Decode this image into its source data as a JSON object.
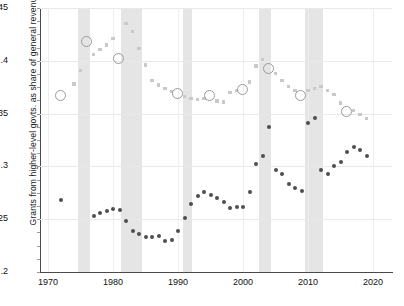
{
  "chart_data": {
    "type": "scatter",
    "title": "",
    "xlabel": "",
    "ylabel": "Grants from higher-level govts. as share of general revenue",
    "xlim": [
      1969,
      2021
    ],
    "ylim": [
      0.2,
      0.45
    ],
    "xticks": [
      1970,
      1980,
      1990,
      2000,
      2010,
      2020
    ],
    "yticks": [
      0.2,
      0.25,
      0.3,
      0.35,
      0.4,
      0.45
    ],
    "ytick_labels": [
      ".2",
      ".25",
      ".3",
      ".35",
      ".4",
      ".45"
    ],
    "grid": true,
    "legend": "none",
    "recession_bands": [
      {
        "start": 1974.6,
        "end": 1976.4
      },
      {
        "start": 1981.2,
        "end": 1984.5
      },
      {
        "start": 1990.7,
        "end": 1992.1
      },
      {
        "start": 2002.5,
        "end": 2004.3
      },
      {
        "start": 2009.5,
        "end": 2012.3
      }
    ],
    "series": [
      {
        "name": "Light series (open-circle census years)",
        "color": "#c9c9c9",
        "marker": "square-small",
        "highlight_marker": "open-circle",
        "points": [
          {
            "x": 1972,
            "y": 0.367,
            "highlight": true
          },
          {
            "x": 1974,
            "y": 0.378,
            "highlight": false
          },
          {
            "x": 1975,
            "y": 0.391,
            "highlight": false
          },
          {
            "x": 1976,
            "y": 0.418,
            "highlight": true
          },
          {
            "x": 1977,
            "y": 0.406,
            "highlight": false
          },
          {
            "x": 1978,
            "y": 0.411,
            "highlight": false
          },
          {
            "x": 1979,
            "y": 0.415,
            "highlight": false
          },
          {
            "x": 1980,
            "y": 0.421,
            "highlight": false
          },
          {
            "x": 1981,
            "y": 0.402,
            "highlight": true
          },
          {
            "x": 1982,
            "y": 0.435,
            "highlight": false
          },
          {
            "x": 1983,
            "y": 0.428,
            "highlight": false
          },
          {
            "x": 1984,
            "y": 0.412,
            "highlight": false
          },
          {
            "x": 1985,
            "y": 0.396,
            "highlight": false
          },
          {
            "x": 1986,
            "y": 0.381,
            "highlight": false
          },
          {
            "x": 1987,
            "y": 0.377,
            "highlight": false
          },
          {
            "x": 1988,
            "y": 0.374,
            "highlight": false
          },
          {
            "x": 1989,
            "y": 0.371,
            "highlight": false
          },
          {
            "x": 1990,
            "y": 0.368,
            "highlight": true
          },
          {
            "x": 1991,
            "y": 0.366,
            "highlight": false
          },
          {
            "x": 1992,
            "y": 0.364,
            "highlight": false
          },
          {
            "x": 1993,
            "y": 0.363,
            "highlight": false
          },
          {
            "x": 1994,
            "y": 0.364,
            "highlight": false
          },
          {
            "x": 1995,
            "y": 0.367,
            "highlight": true
          },
          {
            "x": 1996,
            "y": 0.362,
            "highlight": false
          },
          {
            "x": 1997,
            "y": 0.361,
            "highlight": false
          },
          {
            "x": 1998,
            "y": 0.37,
            "highlight": false
          },
          {
            "x": 1999,
            "y": 0.372,
            "highlight": false
          },
          {
            "x": 2000,
            "y": 0.372,
            "highlight": true
          },
          {
            "x": 2001,
            "y": 0.38,
            "highlight": false
          },
          {
            "x": 2002,
            "y": 0.395,
            "highlight": false
          },
          {
            "x": 2003,
            "y": 0.401,
            "highlight": false
          },
          {
            "x": 2004,
            "y": 0.392,
            "highlight": true
          },
          {
            "x": 2005,
            "y": 0.388,
            "highlight": false
          },
          {
            "x": 2006,
            "y": 0.381,
            "highlight": false
          },
          {
            "x": 2007,
            "y": 0.376,
            "highlight": false
          },
          {
            "x": 2008,
            "y": 0.372,
            "highlight": false
          },
          {
            "x": 2009,
            "y": 0.367,
            "highlight": true
          },
          {
            "x": 2010,
            "y": 0.372,
            "highlight": false
          },
          {
            "x": 2011,
            "y": 0.374,
            "highlight": false
          },
          {
            "x": 2012,
            "y": 0.376,
            "highlight": false
          },
          {
            "x": 2013,
            "y": 0.372,
            "highlight": false
          },
          {
            "x": 2014,
            "y": 0.368,
            "highlight": false
          },
          {
            "x": 2015,
            "y": 0.36,
            "highlight": false
          },
          {
            "x": 2016,
            "y": 0.351,
            "highlight": true
          },
          {
            "x": 2017,
            "y": 0.353,
            "highlight": false
          },
          {
            "x": 2018,
            "y": 0.349,
            "highlight": false
          },
          {
            "x": 2019,
            "y": 0.345,
            "highlight": false
          }
        ]
      },
      {
        "name": "Dark series",
        "color": "#4e4e52",
        "marker": "dot",
        "points": [
          {
            "x": 1972,
            "y": 0.268,
            "highlight": false
          },
          {
            "x": 1977,
            "y": 0.253,
            "highlight": false
          },
          {
            "x": 1978,
            "y": 0.256,
            "highlight": false
          },
          {
            "x": 1979,
            "y": 0.258,
            "highlight": false
          },
          {
            "x": 1980,
            "y": 0.26,
            "highlight": false
          },
          {
            "x": 1981,
            "y": 0.259,
            "highlight": false
          },
          {
            "x": 1982,
            "y": 0.248,
            "highlight": false
          },
          {
            "x": 1983,
            "y": 0.239,
            "highlight": false
          },
          {
            "x": 1984,
            "y": 0.236,
            "highlight": false
          },
          {
            "x": 1985,
            "y": 0.233,
            "highlight": false
          },
          {
            "x": 1986,
            "y": 0.233,
            "highlight": false
          },
          {
            "x": 1987,
            "y": 0.234,
            "highlight": false
          },
          {
            "x": 1988,
            "y": 0.229,
            "highlight": false
          },
          {
            "x": 1989,
            "y": 0.23,
            "highlight": false
          },
          {
            "x": 1990,
            "y": 0.239,
            "highlight": false
          },
          {
            "x": 1991,
            "y": 0.251,
            "highlight": false
          },
          {
            "x": 1992,
            "y": 0.264,
            "highlight": false
          },
          {
            "x": 1993,
            "y": 0.272,
            "highlight": false
          },
          {
            "x": 1994,
            "y": 0.276,
            "highlight": false
          },
          {
            "x": 1995,
            "y": 0.273,
            "highlight": false
          },
          {
            "x": 1996,
            "y": 0.27,
            "highlight": false
          },
          {
            "x": 1997,
            "y": 0.266,
            "highlight": false
          },
          {
            "x": 1998,
            "y": 0.261,
            "highlight": false
          },
          {
            "x": 1999,
            "y": 0.262,
            "highlight": false
          },
          {
            "x": 2000,
            "y": 0.262,
            "highlight": false
          },
          {
            "x": 2001,
            "y": 0.276,
            "highlight": false
          },
          {
            "x": 2002,
            "y": 0.302,
            "highlight": false
          },
          {
            "x": 2003,
            "y": 0.31,
            "highlight": false
          },
          {
            "x": 2004,
            "y": 0.337,
            "highlight": false
          },
          {
            "x": 2005,
            "y": 0.297,
            "highlight": false
          },
          {
            "x": 2006,
            "y": 0.293,
            "highlight": false
          },
          {
            "x": 2007,
            "y": 0.283,
            "highlight": false
          },
          {
            "x": 2008,
            "y": 0.28,
            "highlight": false
          },
          {
            "x": 2009,
            "y": 0.277,
            "highlight": false
          },
          {
            "x": 2010,
            "y": 0.341,
            "highlight": false
          },
          {
            "x": 2011,
            "y": 0.346,
            "highlight": false
          },
          {
            "x": 2012,
            "y": 0.297,
            "highlight": false
          },
          {
            "x": 2013,
            "y": 0.293,
            "highlight": false
          },
          {
            "x": 2014,
            "y": 0.3,
            "highlight": false
          },
          {
            "x": 2015,
            "y": 0.304,
            "highlight": false
          },
          {
            "x": 2016,
            "y": 0.314,
            "highlight": false
          },
          {
            "x": 2017,
            "y": 0.318,
            "highlight": false
          },
          {
            "x": 2018,
            "y": 0.316,
            "highlight": false
          },
          {
            "x": 2019,
            "y": 0.31,
            "highlight": false
          }
        ]
      }
    ]
  }
}
